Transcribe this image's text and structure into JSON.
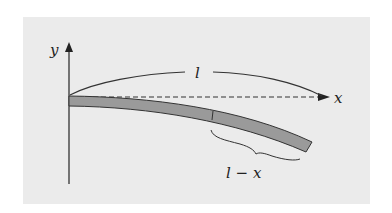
{
  "figure": {
    "labels": {
      "y_axis": "y",
      "x_axis": "x",
      "length": "l",
      "remaining_length": "l − x"
    },
    "colors": {
      "panel_background": "#ebebeb",
      "beam_fill": "#9a9a9a",
      "stroke": "#222222"
    }
  }
}
